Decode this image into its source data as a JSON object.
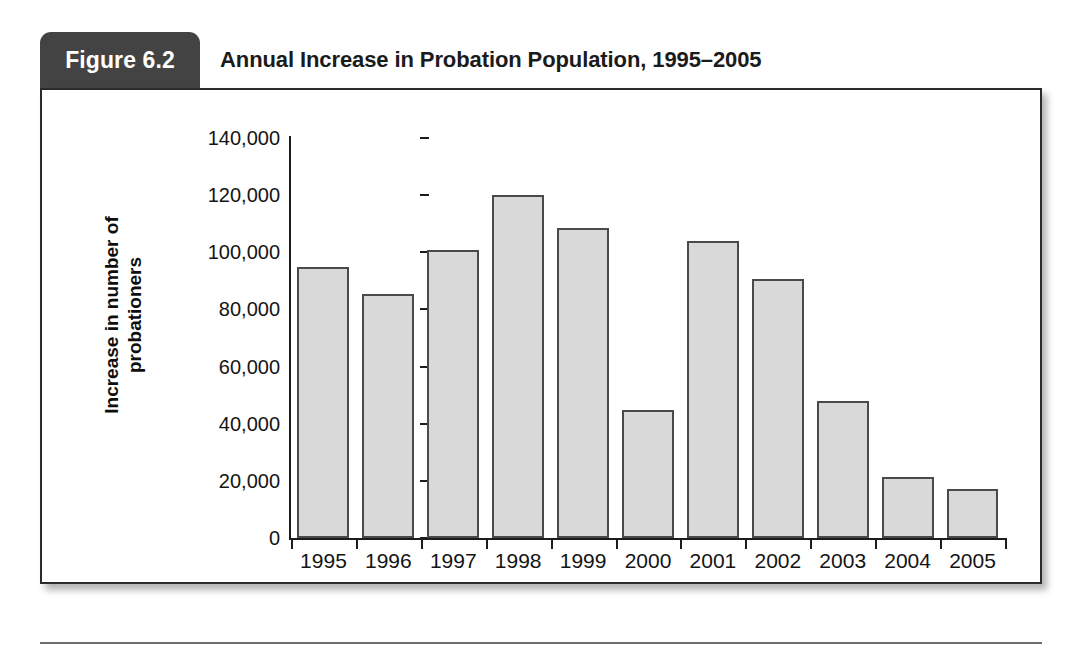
{
  "figure": {
    "badge_label": "Figure 6.2",
    "title": "Annual Increase in Probation Population, 1995–2005"
  },
  "chart_data": {
    "type": "bar",
    "title": "Annual Increase in Probation Population, 1995–2005",
    "xlabel": "",
    "ylabel_line1": "Increase in number of",
    "ylabel_line2": "probationers",
    "ylim": [
      0,
      140000
    ],
    "grid": false,
    "legend": null,
    "bar_fill_color": "#d9d9d9",
    "bar_border_color": "#4a4a4a",
    "categories": [
      "1995",
      "1996",
      "1997",
      "1998",
      "1999",
      "2000",
      "2001",
      "2002",
      "2003",
      "2004",
      "2005"
    ],
    "values": [
      95000,
      85500,
      100800,
      120000,
      108500,
      44800,
      103800,
      90800,
      47800,
      21500,
      17200
    ],
    "ytick_labels": [
      "0",
      "20,000",
      "40,000",
      "60,000",
      "80,000",
      "100,000",
      "120,000",
      "140,000"
    ],
    "ytick_values": [
      0,
      20000,
      40000,
      60000,
      80000,
      100000,
      120000,
      140000
    ]
  }
}
